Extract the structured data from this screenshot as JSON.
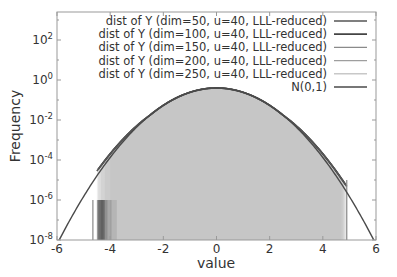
{
  "chart_data": {
    "type": "line",
    "title": "",
    "xlabel": "value",
    "ylabel": "Frequency",
    "xlim": [
      -6,
      6
    ],
    "ylim_log10": [
      -8,
      3.4
    ],
    "yscale": "log",
    "grid": false,
    "legend_position": "upper right",
    "x_ticks": [
      -6,
      -4,
      -2,
      0,
      2,
      4,
      6
    ],
    "x_tick_labels": [
      "-6",
      "-4",
      "-2",
      "0",
      "2",
      "4",
      "6"
    ],
    "y_ticks_log10": [
      2,
      0,
      -2,
      -4,
      -6,
      -8
    ],
    "y_tick_labels": [
      {
        "base": "10",
        "exp": "2"
      },
      {
        "base": "10",
        "exp": "0"
      },
      {
        "base": "10",
        "exp": "-2"
      },
      {
        "base": "10",
        "exp": "-4"
      },
      {
        "base": "10",
        "exp": "-6"
      },
      {
        "base": "10",
        "exp": "-8"
      }
    ],
    "series": [
      {
        "name": "dist of Y (dim=50, u=40, LLL-reduced)",
        "color": "#555555",
        "width": 1.6,
        "kind": "hist",
        "xmin": -4.5,
        "xmax": 4.9
      },
      {
        "name": "dist of Y (dim=100, u=40, LLL-reduced)",
        "color": "#444444",
        "width": 1.8,
        "kind": "hist",
        "xmin": -4.45,
        "xmax": 4.85
      },
      {
        "name": "dist of Y (dim=150, u=40, LLL-reduced)",
        "color": "#8a8a8a",
        "width": 1.2,
        "kind": "hist",
        "xmin": -4.35,
        "xmax": 4.8
      },
      {
        "name": "dist of Y (dim=200, u=40, LLL-reduced)",
        "color": "#9e9e9e",
        "width": 1.2,
        "kind": "hist",
        "xmin": -4.2,
        "xmax": 4.75
      },
      {
        "name": "dist of Y (dim=250, u=40, LLL-reduced)",
        "color": "#c8c8c8",
        "width": 1.2,
        "kind": "hist",
        "xmin": -4.0,
        "xmax": 4.7
      },
      {
        "name": "N(0,1)",
        "color": "#4a4a4a",
        "width": 1.4,
        "kind": "pdf",
        "xmin": -6,
        "xmax": 6
      }
    ],
    "annotations": [
      {
        "type": "vline",
        "x": -4.65,
        "y_log10_top": -6,
        "color": "#888888"
      },
      {
        "type": "vline",
        "x": 4.9,
        "y_log10_top": -5.0,
        "color": "#888888"
      }
    ],
    "peak": {
      "x": 0,
      "y": 0.399
    }
  }
}
